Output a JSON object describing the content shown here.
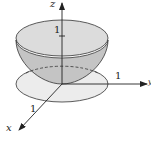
{
  "figure": {
    "axes": {
      "z": {
        "label": "z"
      },
      "y": {
        "label": "y"
      },
      "x": {
        "label": "x"
      }
    },
    "tick_labels": {
      "z_one": "1",
      "y_one": "1",
      "x_one": "1"
    },
    "colors": {
      "surface_outer": "#d4d4d4",
      "surface_inner": "#bcbcbc",
      "top_cap": "#dedede",
      "disk": "#ececec",
      "stroke": "#222222"
    }
  }
}
